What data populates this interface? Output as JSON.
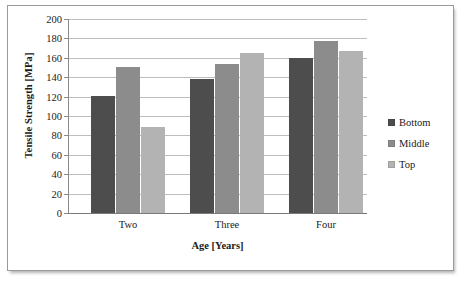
{
  "chart_data": {
    "type": "bar",
    "title": "",
    "subtitle": "",
    "xlabel": "Age [Years]",
    "ylabel": "Tensile Strength [MPa]",
    "categories": [
      "Two",
      "Three",
      "Four"
    ],
    "series": [
      {
        "name": "Bottom",
        "color": "#4d4d4d",
        "values": [
          121,
          138,
          160
        ]
      },
      {
        "name": "Middle",
        "color": "#8c8c8c",
        "values": [
          151,
          154,
          177
        ]
      },
      {
        "name": "Top",
        "color": "#b3b3b3",
        "values": [
          89,
          165,
          167
        ]
      }
    ],
    "ylim": [
      0,
      200
    ],
    "ytick_step": 20,
    "ytick_labels": [
      "200",
      "180",
      "160",
      "140",
      "120",
      "100",
      "80",
      "60",
      "40",
      "20",
      "0"
    ],
    "ytick_values": [
      200,
      180,
      160,
      140,
      120,
      100,
      80,
      60,
      40,
      20,
      0
    ],
    "grid": true,
    "grid_axis": "y",
    "legend_position": "right",
    "legend_entries": [
      "Bottom",
      "Middle",
      "Top"
    ],
    "annotations": []
  }
}
